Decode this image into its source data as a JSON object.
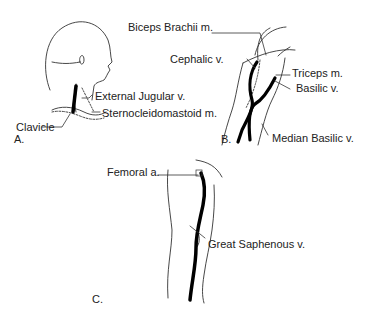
{
  "panels": [
    {
      "id": "A",
      "label": "A.",
      "region": "neck",
      "annotations": [
        "External Jugular v.",
        "Sternocleidomastoid m.",
        "Clavicle"
      ]
    },
    {
      "id": "B",
      "label": "B.",
      "region": "arm",
      "annotations": [
        "Biceps Brachii m.",
        "Cephalic v.",
        "Triceps m.",
        "Basilic v.",
        "Median Basilic v."
      ]
    },
    {
      "id": "C",
      "label": "C.",
      "region": "leg",
      "annotations": [
        "Femoral a.",
        "Great Saphenous v."
      ]
    }
  ]
}
